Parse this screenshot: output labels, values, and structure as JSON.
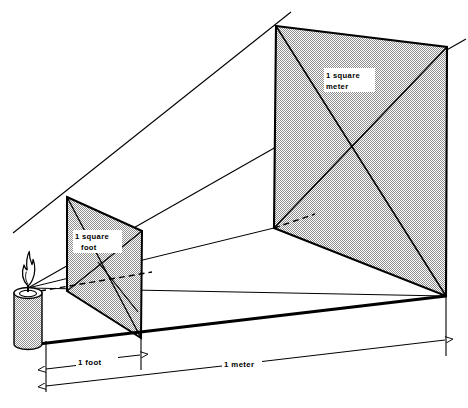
{
  "figure": {
    "type": "technical-illustration",
    "background_color": "#ffffff",
    "line_color": "#000000",
    "shade_color": "#c9c9c9"
  },
  "labels": {
    "square_foot_line1": "1 square",
    "square_foot_line2": "foot",
    "square_meter_line1": "1 square",
    "square_meter_line2": "meter",
    "dimension_foot": "1 foot",
    "dimension_meter": "1 meter"
  },
  "elements": {
    "candle_name": "candle",
    "flame_name": "flame",
    "near_plane_name": "one-square-foot-plane",
    "far_plane_name": "one-square-meter-plane",
    "baseline_name": "ground-baseline",
    "ray_name": "light-ray",
    "dashed_name": "hidden-edge-dashed"
  },
  "geometry": {
    "small_square": {
      "top_left": [
        67,
        197
      ],
      "top_right": [
        142,
        231
      ],
      "bottom_right": [
        141,
        338
      ],
      "bottom_left": [
        67,
        291
      ]
    },
    "large_square": {
      "top_left": [
        276,
        26
      ],
      "top_right": [
        447,
        47
      ],
      "bottom_right": [
        446,
        296
      ],
      "bottom_left": [
        274,
        228
      ]
    },
    "candle_apex": [
      28,
      288
    ],
    "baseline": [
      [
        30,
        344
      ],
      [
        446,
        296
      ]
    ],
    "foot_arrow": [
      [
        46,
        367
      ],
      [
        141,
        356
      ]
    ],
    "meter_arrow": [
      [
        46,
        384
      ],
      [
        446,
        338
      ]
    ]
  }
}
